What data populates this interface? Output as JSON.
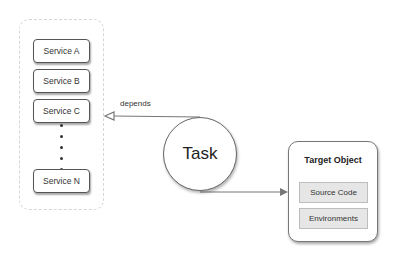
{
  "services": {
    "container_label": "",
    "items": [
      {
        "label": "Service A"
      },
      {
        "label": "Service B"
      },
      {
        "label": "Service C"
      },
      {
        "label": "Service N"
      }
    ]
  },
  "edges": {
    "depends_label": "depends"
  },
  "task": {
    "label": "Task"
  },
  "target": {
    "title": "Target Object",
    "items": [
      {
        "label": "Source Code"
      },
      {
        "label": "Environments"
      }
    ]
  },
  "colors": {
    "stroke": "#666666",
    "item_fill": "#e6e6e6",
    "container_border": "#d6d6d6"
  }
}
